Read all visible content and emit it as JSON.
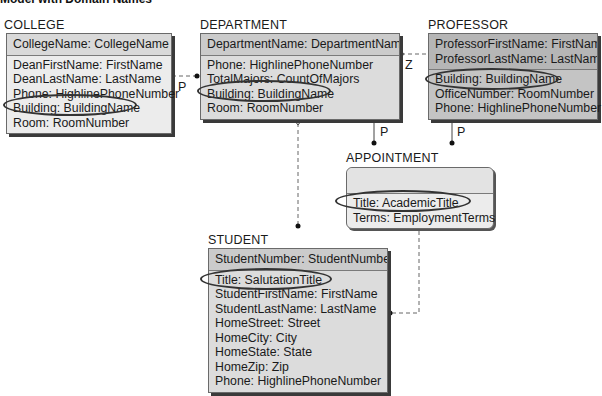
{
  "title": "Model with Domain Names",
  "entities": {
    "college": {
      "name": "COLLEGE",
      "key": [
        "CollegeName: CollegeName"
      ],
      "attributes": [
        "DeanFirstName: FirstName",
        "DeanLastName: LastName",
        "Phone: HighlinePhoneNumber",
        "Building: BuildingName",
        "Room: RoomNumber"
      ]
    },
    "department": {
      "name": "DEPARTMENT",
      "key": [
        "DepartmentName: DepartmentName"
      ],
      "attributes": [
        "Phone: HighlinePhoneNumber",
        "TotalMajors: CountOfMajors",
        "Building: BuildingName",
        "Room: RoomNumber"
      ]
    },
    "professor": {
      "name": "PROFESSOR",
      "key": [
        "ProfessorFirstName: FirstName",
        "ProfessorLastName: LastName"
      ],
      "attributes": [
        "Building: BuildingName",
        "OfficeNumber: RoomNumber",
        "Phone: HighlinePhoneNumber"
      ]
    },
    "appointment": {
      "name": "APPOINTMENT",
      "key": [],
      "attributes": [
        "Title: AcademicTitle",
        "Terms: EmploymentTerms"
      ]
    },
    "student": {
      "name": "STUDENT",
      "key": [
        "StudentNumber: StudentNumber"
      ],
      "attributes": [
        "Title: SalutationTitle",
        "StudentFirstName: FirstName",
        "StudentLastName: LastName",
        "HomeStreet: Street",
        "HomeCity: City",
        "HomeState: State",
        "HomeZip: Zip",
        "Phone: HighlinePhoneNumber"
      ]
    }
  },
  "relationships": [
    {
      "from": "COLLEGE",
      "to": "DEPARTMENT",
      "label": "P"
    },
    {
      "from": "DEPARTMENT",
      "to": "PROFESSOR",
      "label": "Z"
    },
    {
      "from": "DEPARTMENT",
      "to": "APPOINTMENT",
      "label": "P"
    },
    {
      "from": "PROFESSOR",
      "to": "APPOINTMENT",
      "label": "P"
    },
    {
      "from": "DEPARTMENT",
      "to": "STUDENT",
      "label": ""
    },
    {
      "from": "APPOINTMENT",
      "to": "STUDENT",
      "label": ""
    }
  ],
  "labels": {
    "p1": "P",
    "z": "Z",
    "p2": "P",
    "p3": "P"
  }
}
